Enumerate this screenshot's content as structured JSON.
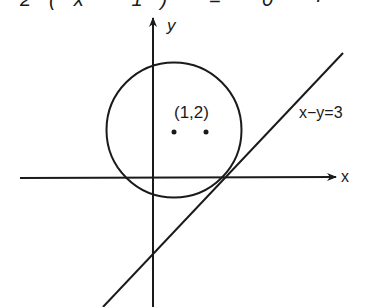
{
  "figure": {
    "top_cut_text": "2(x−1) = 0 ·",
    "axes": {
      "x_label": "x",
      "y_label": "y"
    },
    "point_label": "(1,2)",
    "line_label": "x−y=3",
    "colors": {
      "ink": "#1a1a1a",
      "background": "#ffffff"
    }
  }
}
